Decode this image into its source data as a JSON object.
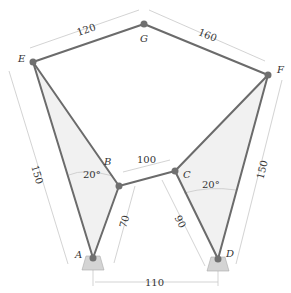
{
  "colors": {
    "link": "#6b6b6b",
    "joint": "#707070",
    "dimension": "#c8c8c8",
    "fill": "#f1f1f1",
    "ground": "#d4d4d4",
    "ground_stroke": "#aaaaaa"
  },
  "points": {
    "A": {
      "label": "A",
      "x": 93,
      "y": 258
    },
    "B": {
      "label": "B",
      "x": 119,
      "y": 186
    },
    "C": {
      "label": "C",
      "x": 175,
      "y": 171
    },
    "D": {
      "label": "D",
      "x": 218,
      "y": 259
    },
    "E": {
      "label": "E",
      "x": 33,
      "y": 62
    },
    "F": {
      "label": "F",
      "x": 268,
      "y": 75
    },
    "G": {
      "label": "G",
      "x": 144,
      "y": 24
    }
  },
  "dimensions": {
    "EG": "120",
    "GF": "160",
    "EA": "150",
    "FD": "150",
    "BC": "100",
    "AB": "70",
    "CD": "90",
    "AD": "110",
    "angle_left": "20°",
    "angle_right": "20°"
  }
}
